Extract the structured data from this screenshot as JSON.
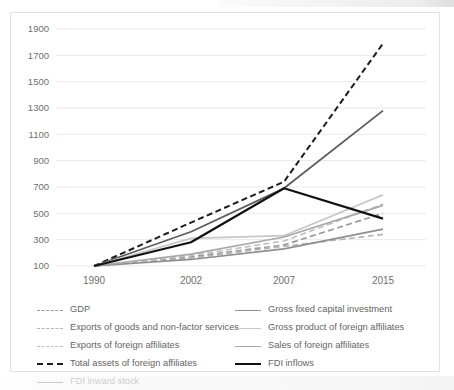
{
  "chart_data": {
    "type": "line",
    "title": "",
    "xlabel": "",
    "ylabel": "",
    "x": [
      1990,
      2002,
      2007,
      2015
    ],
    "xtick_labels": [
      "1990",
      "2002",
      "2007",
      "2015"
    ],
    "ytick_labels": [
      "100",
      "300",
      "500",
      "700",
      "900",
      "1100",
      "1300",
      "1500",
      "1700",
      "1900"
    ],
    "ytick_values": [
      100,
      300,
      500,
      700,
      900,
      1100,
      1300,
      1500,
      1700,
      1900
    ],
    "ylim": [
      100,
      1900
    ],
    "grid": "horizontal",
    "legend_position": "bottom",
    "index_base": "1990 = 100",
    "series": [
      {
        "name": "GDP",
        "values": [
          100,
          170,
          260,
          500
        ],
        "color": "#9a9a9a",
        "style": "dashed",
        "width": 1.7
      },
      {
        "name": "Exports of goods and non-factor services",
        "values": [
          100,
          160,
          250,
          340
        ],
        "color": "#b4b4b4",
        "style": "dashed",
        "width": 1.7
      },
      {
        "name": "Exports of foreign affiliates",
        "values": [
          100,
          180,
          290,
          570
        ],
        "color": "#c2c2c2",
        "style": "dashed",
        "width": 1.7
      },
      {
        "name": "Total assets of foreign affiliates",
        "values": [
          100,
          430,
          740,
          1790
        ],
        "color": "#1c1c1c",
        "style": "dashed",
        "width": 2.0
      },
      {
        "name": "FDI inward stock",
        "values": [
          100,
          360,
          690,
          1280
        ],
        "color": "#5c5c5c",
        "style": "solid",
        "width": 1.8
      },
      {
        "name": "Gross fixed capital investment",
        "values": [
          100,
          150,
          230,
          380
        ],
        "color": "#8e8e8e",
        "style": "solid",
        "width": 1.6
      },
      {
        "name": "Gross product of foreign affiliates",
        "values": [
          100,
          310,
          330,
          640
        ],
        "color": "#c8c8c8",
        "style": "solid",
        "width": 1.8
      },
      {
        "name": "Sales of foreign affiliates",
        "values": [
          100,
          190,
          320,
          560
        ],
        "color": "#a8a8a8",
        "style": "solid",
        "width": 1.7
      },
      {
        "name": "FDI inflows",
        "values": [
          100,
          280,
          690,
          460
        ],
        "color": "#111111",
        "style": "solid",
        "width": 2.2
      }
    ]
  },
  "legend": {
    "left_column": [
      "GDP",
      "Exports of goods and non-factor services",
      "Exports of foreign affiliates",
      "Total assets of foreign affiliates",
      "FDI inward stock"
    ],
    "right_column": [
      "Gross fixed capital investment",
      "Gross product of foreign affiliates",
      "Sales of foreign affiliates",
      "FDI inflows"
    ]
  },
  "colors": {
    "background": "#ffffff",
    "card_border": "#e3e3e3",
    "gridline": "#e9e9e9",
    "tick_text": "#6f6f6f",
    "legend_text": "#646464"
  }
}
